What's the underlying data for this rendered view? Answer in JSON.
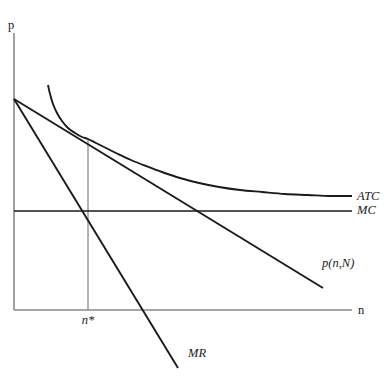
{
  "figure": {
    "background_color": "#ffffff",
    "axis_color": "#8a8a8a",
    "curve_color": "#1a1a1a"
  },
  "axes": {
    "y_axis_label": "p",
    "x_axis_label": "n",
    "y_axis_top_px": 33,
    "y_axis_bottom_px": 310,
    "x_axis_left_px": 14,
    "x_axis_right_px": 352
  },
  "labels": {
    "atc": "ATC",
    "mc": "MC",
    "demand": "p(n,N)",
    "marginal_revenue": "MR",
    "optimum_quantity": "n*"
  },
  "chart_data": {
    "type": "line",
    "title": "",
    "xlabel": "n",
    "ylabel": "p",
    "grid": false,
    "legend_position": "right-inline",
    "axis_origin_px": [
      14,
      310
    ],
    "xlim_px": [
      14,
      352
    ],
    "ylim_px": [
      310,
      33
    ],
    "annotations": [
      {
        "name": "tangency-point",
        "text": "",
        "x_px": 88,
        "y_px": 139,
        "note": "ATC tangent to p(n,N); defines n*"
      },
      {
        "name": "mr-mc-intersection",
        "text": "",
        "x_px": 88,
        "y_px": 211,
        "note": "MR crosses MC at n*"
      }
    ],
    "ticks": [
      {
        "axis": "x",
        "label": "n*",
        "x_px": 88,
        "y_px": 321
      }
    ],
    "series": [
      {
        "name": "ATC",
        "label": "ATC",
        "style": "curve",
        "label_px": [
          357,
          200
        ],
        "points_px": [
          [
            48,
            85
          ],
          [
            50,
            94
          ],
          [
            53,
            104
          ],
          [
            57,
            113
          ],
          [
            62,
            121
          ],
          [
            68,
            128
          ],
          [
            75,
            133
          ],
          [
            82,
            137
          ],
          [
            88,
            139
          ],
          [
            96,
            143
          ],
          [
            106,
            148
          ],
          [
            118,
            154
          ],
          [
            131,
            160
          ],
          [
            146,
            166
          ],
          [
            162,
            172
          ],
          [
            180,
            178
          ],
          [
            199,
            183
          ],
          [
            219,
            187
          ],
          [
            240,
            190
          ],
          [
            262,
            192
          ],
          [
            285,
            194
          ],
          [
            308,
            195
          ],
          [
            330,
            196
          ],
          [
            352,
            196
          ]
        ]
      },
      {
        "name": "MC",
        "label": "MC",
        "style": "straight",
        "label_px": [
          357,
          214
        ],
        "points_px": [
          [
            14,
            211
          ],
          [
            352,
            211
          ]
        ]
      },
      {
        "name": "p(n,N)",
        "label": "p(n,N)",
        "style": "straight",
        "label_px": [
          322,
          267
        ],
        "points_px": [
          [
            14,
            99
          ],
          [
            323,
            288
          ]
        ]
      },
      {
        "name": "MR",
        "label": "MR",
        "style": "straight",
        "label_px": [
          188,
          357
        ],
        "points_px": [
          [
            14,
            99
          ],
          [
            178,
            368
          ]
        ]
      },
      {
        "name": "n-star-guide",
        "label": "",
        "style": "guide",
        "label_px": [
          0,
          0
        ],
        "points_px": [
          [
            88,
            139
          ],
          [
            88,
            310
          ]
        ]
      }
    ]
  }
}
